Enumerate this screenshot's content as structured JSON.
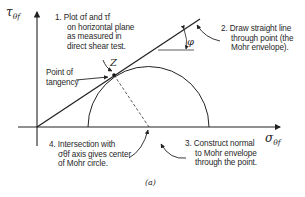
{
  "figure": {
    "caption": "(a)",
    "axes": {
      "y_label": "τ",
      "y_sub": "θf",
      "x_label": "σ",
      "x_sub": "θf"
    },
    "point_label": "Z",
    "angle_label": "φ",
    "tangency_label": [
      "Point of",
      "tangency"
    ],
    "steps": [
      {
        "id": 1,
        "lines": [
          "1. Plot σf and τf",
          "on horizontal plane",
          "as measured in",
          "direct shear test."
        ]
      },
      {
        "id": 2,
        "lines": [
          "2. Draw straight line",
          "through point (the",
          "Mohr envelope)."
        ]
      },
      {
        "id": 3,
        "lines": [
          "3. Construct normal",
          "to Mohr envelope",
          "through the point."
        ]
      },
      {
        "id": 4,
        "lines": [
          "4. Intersection with",
          "σθf axis gives center",
          "of Mohr circle."
        ]
      }
    ]
  }
}
